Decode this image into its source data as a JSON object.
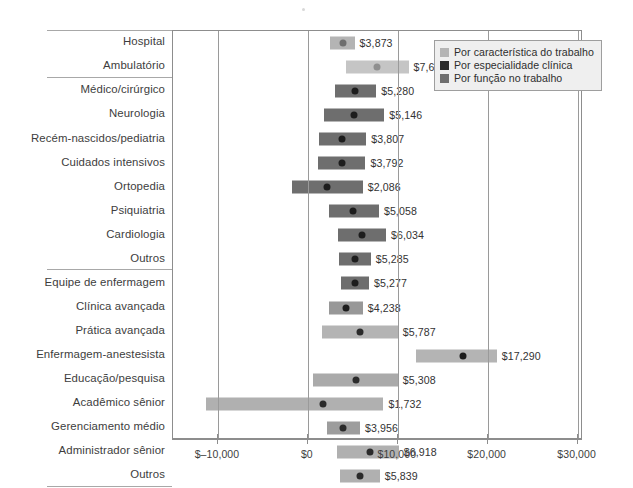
{
  "chart_data": {
    "type": "bar",
    "title": "",
    "subtitle": "",
    "xlabel": "",
    "ylabel": "",
    "xlim": [
      -15000,
      30600
    ],
    "xticks": [
      -10000,
      0,
      10000,
      20000,
      30000
    ],
    "xticklabels": [
      "$–10,000",
      "$0",
      "$10,000",
      "$20,000",
      "$30,000"
    ],
    "grid": "vertical gridlines at each x tick",
    "legend_position": "top-right inside plot",
    "orientation": "horizontal",
    "marker_note": "Black dot = point estimate; bar = confidence interval range",
    "legend": [
      {
        "label": "Por característica do trabalho",
        "color": "#b4b4b4"
      },
      {
        "label": "Por especialidade clínica",
        "color": "#2b2b2b"
      },
      {
        "label": "Por função no trabalho",
        "color": "#6e6e6e"
      }
    ],
    "groups": [
      {
        "name": "Por característica do trabalho",
        "count": 2
      },
      {
        "name": "Por especialidade clínica",
        "count": 8
      },
      {
        "name": "Por função no trabalho",
        "count": 9
      }
    ],
    "categories": [
      "Hospital",
      "Ambulatório",
      "Médico/cirúrgico",
      "Neurologia",
      "Recém-nascidos/pediatria",
      "Cuidados intensivos",
      "Ortopedia",
      "Psiquiatria",
      "Cardiologia",
      "Outros",
      "Equipe de enfermagem",
      "Clínica avançada",
      "Prática avançada",
      "Enfermagem-anestesista",
      "Educação/pesquisa",
      "Acadêmico sênior",
      "Gerenciamento médio",
      "Administrador sênior",
      "Outros"
    ],
    "values": [
      3873,
      7678,
      5280,
      5146,
      3807,
      3792,
      2086,
      5058,
      6034,
      5285,
      5277,
      4238,
      5787,
      17290,
      5308,
      1732,
      3956,
      6918,
      5839
    ],
    "value_labels": [
      "$3,873",
      "$7,678",
      "$5,280",
      "$5,146",
      "$3,807",
      "$3,792",
      "$2,086",
      "$5,058",
      "$6,034",
      "$5,285",
      "$5,277",
      "$4,238",
      "$5,787",
      "$17,290",
      "$5,308",
      "$1,732",
      "$3,956",
      "$6,918",
      "$5,839"
    ],
    "ranges": [
      {
        "low": 2500,
        "high": 5200
      },
      {
        "low": 4200,
        "high": 11200
      },
      {
        "low": 3000,
        "high": 7600
      },
      {
        "low": 1800,
        "high": 8500
      },
      {
        "low": 1200,
        "high": 6500
      },
      {
        "low": 1100,
        "high": 6400
      },
      {
        "low": -1800,
        "high": 6100
      },
      {
        "low": 2300,
        "high": 7900
      },
      {
        "low": 3400,
        "high": 8700
      },
      {
        "low": 3500,
        "high": 7000
      },
      {
        "low": 3700,
        "high": 6800
      },
      {
        "low": 2400,
        "high": 6100
      },
      {
        "low": 1600,
        "high": 10000
      },
      {
        "low": 12000,
        "high": 21000
      },
      {
        "low": 600,
        "high": 10000
      },
      {
        "low": -11300,
        "high": 8400
      },
      {
        "low": 2100,
        "high": 5800
      },
      {
        "low": 3200,
        "high": 10100
      },
      {
        "low": 3600,
        "high": 8000
      }
    ],
    "bar_colors": [
      "#b4b4b4",
      "#c5c5c5",
      "#6e6e6e",
      "#6e6e6e",
      "#6e6e6e",
      "#6e6e6e",
      "#6e6e6e",
      "#6e6e6e",
      "#6e6e6e",
      "#6e6e6e",
      "#6e6e6e",
      "#989898",
      "#b4b4b4",
      "#b4b4b4",
      "#aaaaaa",
      "#b0b0b0",
      "#9d9d9d",
      "#b0b0b0",
      "#b0b0b0"
    ],
    "dot_colors": [
      "#6e6e6e",
      "#8f8f8f",
      "#1d1d1d",
      "#1d1d1d",
      "#1d1d1d",
      "#1d1d1d",
      "#1d1d1d",
      "#1d1d1d",
      "#1d1d1d",
      "#1d1d1d",
      "#1d1d1d",
      "#1d1d1d",
      "#2b2b2b",
      "#1d1d1d",
      "#2b2b2b",
      "#2b2b2b",
      "#2b2b2b",
      "#2b2b2b",
      "#2b2b2b"
    ]
  }
}
